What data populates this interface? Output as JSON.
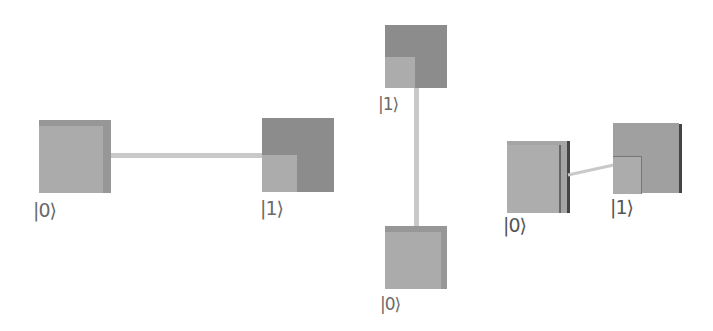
{
  "colors": {
    "light_face": "#ababab",
    "dark_face": "#8c8c8c",
    "edge": "#979797",
    "dark_edge": "#555555",
    "connector": "#c9c9c9",
    "label": "#6a6a6a"
  },
  "horizontal_pair": {
    "left": {
      "state": "|0⟩"
    },
    "right": {
      "state": "|1⟩"
    }
  },
  "vertical_pair": {
    "top": {
      "state": "|1⟩"
    },
    "bottom": {
      "state": "|0⟩"
    }
  },
  "perspective_pair": {
    "left": {
      "state": "|0⟩"
    },
    "right": {
      "state": "|1⟩"
    }
  }
}
